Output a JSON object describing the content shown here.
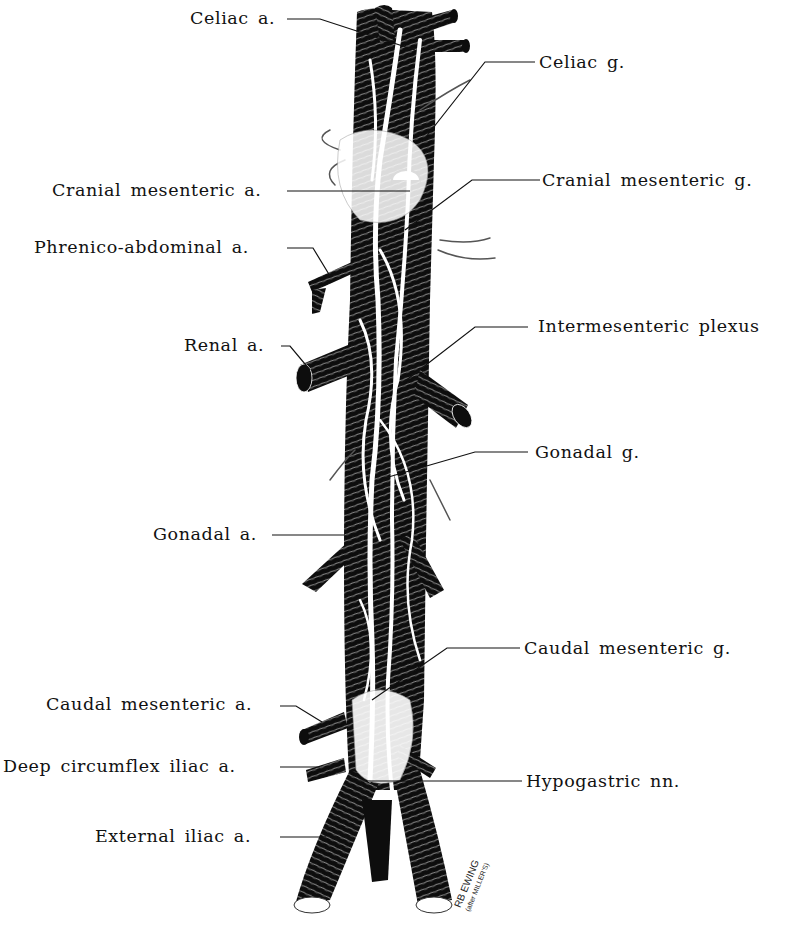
{
  "figure": {
    "colors": {
      "background": "#ffffff",
      "ink": "#111111",
      "vessel": "#0d0d0d",
      "nerve": "#ffffff"
    },
    "labels_left": [
      {
        "id": "celiac-a",
        "text": "Celiac a."
      },
      {
        "id": "cranial-mesenteric-a",
        "text": "Cranial mesenteric a."
      },
      {
        "id": "phrenico-abdominal-a",
        "text": "Phrenico-abdominal a."
      },
      {
        "id": "renal-a",
        "text": "Renal a."
      },
      {
        "id": "gonadal-a",
        "text": "Gonadal a."
      },
      {
        "id": "caudal-mesenteric-a",
        "text": "Caudal mesenteric a."
      },
      {
        "id": "deep-circumflex-iliac-a",
        "text": "Deep circumflex iliac a."
      },
      {
        "id": "external-iliac-a",
        "text": "External iliac a."
      }
    ],
    "labels_right": [
      {
        "id": "celiac-g",
        "text": "Celiac g."
      },
      {
        "id": "cranial-mesenteric-g",
        "text": "Cranial mesenteric g."
      },
      {
        "id": "intermesenteric-plexus",
        "text": "Intermesenteric plexus"
      },
      {
        "id": "gonadal-g",
        "text": "Gonadal g."
      },
      {
        "id": "caudal-mesenteric-g",
        "text": "Caudal mesenteric g."
      },
      {
        "id": "hypogastric-nn",
        "text": "Hypogastric nn."
      }
    ],
    "signature": {
      "line1": "RB EWING",
      "line2": "(after MILLER'S)"
    }
  }
}
